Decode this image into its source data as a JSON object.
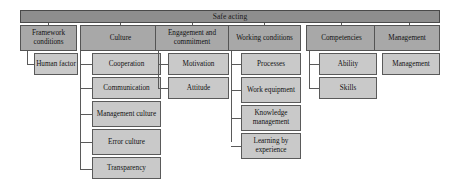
{
  "diagram": {
    "title": "Safe acting",
    "root": {
      "label": "Safe acting"
    },
    "columns": [
      {
        "id": "framework-conditions",
        "head": "Framework conditions",
        "children": [
          "Human factor"
        ]
      },
      {
        "id": "culture",
        "head": "Culture",
        "children": [
          "Cooperation",
          "Communication",
          "Management culture",
          "Error culture",
          "Transparency"
        ]
      },
      {
        "id": "engagement-and-commitment",
        "head": "Engagement and commitment",
        "children": [
          "Motivation",
          "Attitude"
        ]
      },
      {
        "id": "working-conditions",
        "head": "Working conditions",
        "children": [
          "Processes",
          "Work equipment",
          "Knowledge management",
          "Learning by experience"
        ]
      },
      {
        "id": "competencies",
        "head": "Competencies",
        "children": [
          "Ability",
          "Skills"
        ]
      },
      {
        "id": "management",
        "head": "Management",
        "children": [
          "Management"
        ]
      }
    ],
    "colors": {
      "root_fill": "#8e8e8e",
      "head_fill": "#a8a8a8",
      "child_fill": "#c9c9c9",
      "stroke": "#545454",
      "text": "#121212",
      "background": "#ffffff"
    }
  }
}
